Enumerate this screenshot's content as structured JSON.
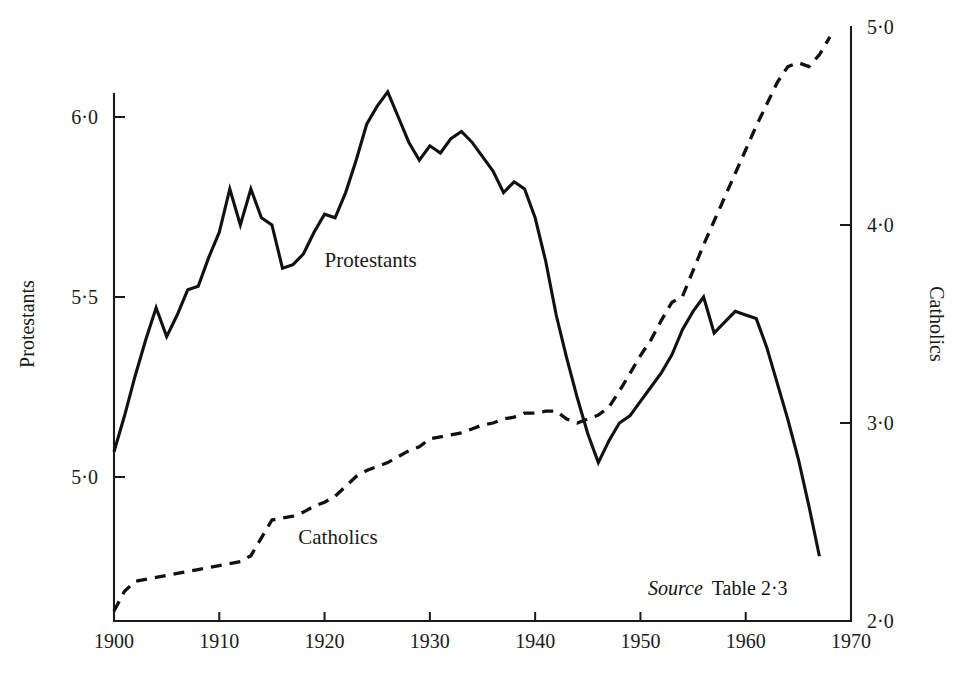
{
  "chart_data": {
    "type": "line",
    "title": "",
    "xlabel": "",
    "ylabel": "Protestants",
    "y2label": "Catholics",
    "xlim": [
      1900,
      1970
    ],
    "ylim": [
      4.6,
      6.25
    ],
    "y2lim": [
      2.0,
      5.0
    ],
    "grid": false,
    "legend": "inline-labels",
    "x_ticks": [
      1900,
      1910,
      1920,
      1930,
      1940,
      1950,
      1960,
      1970
    ],
    "x_tick_labels": [
      "1900",
      "1910",
      "1920",
      "1930",
      "1940",
      "1950",
      "1960",
      "1970"
    ],
    "y_ticks": [
      5.0,
      5.5,
      6.0
    ],
    "y_tick_labels": [
      "5·0",
      "5·5",
      "6·0"
    ],
    "y2_ticks": [
      2.0,
      3.0,
      4.0,
      5.0
    ],
    "y2_tick_labels": [
      "2·0",
      "3·0",
      "4·0",
      "5·0"
    ],
    "series": [
      {
        "name": "Protestants",
        "axis": "left",
        "style": "solid",
        "label_x": 1920.0,
        "label_y": 5.6,
        "x": [
          1900,
          1901,
          1902,
          1903,
          1904,
          1905,
          1906,
          1907,
          1908,
          1909,
          1910,
          1911,
          1912,
          1913,
          1914,
          1915,
          1916,
          1917,
          1918,
          1919,
          1920,
          1921,
          1922,
          1923,
          1924,
          1925,
          1926,
          1927,
          1928,
          1929,
          1930,
          1931,
          1932,
          1933,
          1934,
          1935,
          1936,
          1937,
          1938,
          1939,
          1940,
          1941,
          1942,
          1943,
          1944,
          1945,
          1946,
          1947,
          1948,
          1949,
          1950,
          1951,
          1952,
          1953,
          1954,
          1955,
          1956,
          1957,
          1958,
          1959,
          1960,
          1961,
          1962,
          1963,
          1964,
          1965,
          1966,
          1967
        ],
        "y": [
          5.07,
          5.17,
          5.28,
          5.38,
          5.47,
          5.39,
          5.45,
          5.52,
          5.53,
          5.61,
          5.68,
          5.8,
          5.7,
          5.8,
          5.72,
          5.7,
          5.58,
          5.59,
          5.62,
          5.68,
          5.73,
          5.72,
          5.79,
          5.88,
          5.98,
          6.03,
          6.07,
          6.0,
          5.93,
          5.88,
          5.92,
          5.9,
          5.94,
          5.96,
          5.93,
          5.89,
          5.85,
          5.79,
          5.82,
          5.8,
          5.72,
          5.6,
          5.45,
          5.33,
          5.22,
          5.12,
          5.04,
          5.1,
          5.15,
          5.17,
          5.21,
          5.25,
          5.29,
          5.34,
          5.41,
          5.46,
          5.5,
          5.4,
          5.43,
          5.46,
          5.45,
          5.44,
          5.36,
          5.26,
          5.16,
          5.05,
          4.92,
          4.78
        ]
      },
      {
        "name": "Catholics",
        "axis": "right",
        "style": "dashed",
        "label_x": 1917.5,
        "label_y_right": 2.42,
        "x": [
          1900,
          1901,
          1902,
          1903,
          1904,
          1905,
          1906,
          1907,
          1908,
          1909,
          1910,
          1911,
          1912,
          1913,
          1914,
          1915,
          1916,
          1917,
          1918,
          1919,
          1920,
          1921,
          1922,
          1923,
          1924,
          1925,
          1926,
          1927,
          1928,
          1929,
          1930,
          1931,
          1932,
          1933,
          1934,
          1935,
          1936,
          1937,
          1938,
          1939,
          1940,
          1941,
          1942,
          1943,
          1944,
          1945,
          1946,
          1947,
          1948,
          1949,
          1950,
          1951,
          1952,
          1953,
          1954,
          1955,
          1956,
          1957,
          1958,
          1959,
          1960,
          1961,
          1962,
          1963,
          1964,
          1965,
          1966,
          1967,
          1968
        ],
        "y": [
          2.05,
          2.15,
          2.2,
          2.21,
          2.22,
          2.23,
          2.24,
          2.25,
          2.26,
          2.27,
          2.28,
          2.29,
          2.3,
          2.33,
          2.42,
          2.51,
          2.52,
          2.53,
          2.55,
          2.58,
          2.6,
          2.63,
          2.68,
          2.73,
          2.76,
          2.78,
          2.8,
          2.83,
          2.86,
          2.88,
          2.92,
          2.93,
          2.94,
          2.95,
          2.97,
          2.99,
          3.0,
          3.02,
          3.03,
          3.05,
          3.05,
          3.06,
          3.06,
          3.02,
          3.0,
          3.02,
          3.04,
          3.08,
          3.16,
          3.25,
          3.34,
          3.42,
          3.52,
          3.61,
          3.64,
          3.77,
          3.9,
          4.02,
          4.14,
          4.26,
          4.38,
          4.5,
          4.61,
          4.72,
          4.8,
          4.82,
          4.8,
          4.86,
          4.95
        ]
      }
    ],
    "annotations": [
      {
        "name": "source-note",
        "prefix": "Source",
        "text": "Table 2·3"
      }
    ]
  },
  "labels": {
    "y_axis_title": "Protestants",
    "y2_axis_title": "Catholics",
    "series_protestants": "Protestants",
    "series_catholics": "Catholics",
    "source_prefix": "Source",
    "source_reference": "Table 2·3"
  },
  "colors": {
    "ink": "#111111",
    "background": "#ffffff"
  }
}
